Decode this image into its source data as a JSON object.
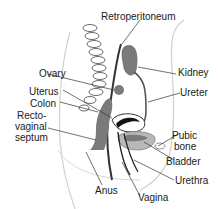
{
  "diagram": {
    "labels": {
      "retroperitoneum": "Retroperitoneum",
      "ovary": "Ovary",
      "kidney": "Kidney",
      "uterus": "Uterus",
      "colon": "Colon",
      "ureter": "Ureter",
      "rectovaginal_1": "Recto-",
      "rectovaginal_2": "vaginal",
      "rectovaginal_3": "septum",
      "pubic_1": "Pubic",
      "pubic_2": "bone",
      "bladder": "Bladder",
      "urethra": "Urethra",
      "anus": "Anus",
      "vagina": "Vagina"
    },
    "colors": {
      "background": "#ffffff",
      "organ_dark": "#7a7a7a",
      "organ_light": "#b8b8b8",
      "outline": "#2a2a2a",
      "body_outline": "#d0d0d0",
      "uterus_black": "#111111"
    }
  }
}
